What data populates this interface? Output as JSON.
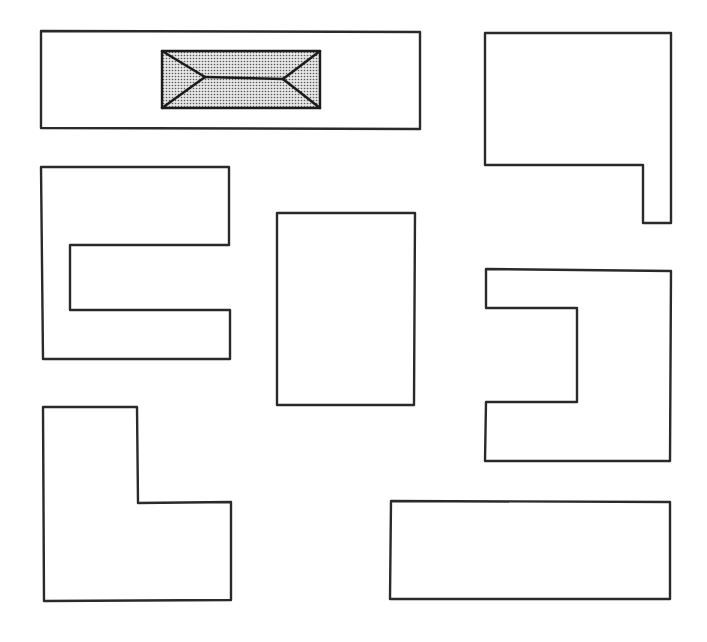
{
  "diagram": {
    "type": "building-footprints-plan",
    "stroke_color": "#2a2a2a",
    "roof_fill_color": "#c8c8c8",
    "shapes": [
      {
        "name": "wide-rectangle-with-hip-roof",
        "points": "41,31 420,32 420,129 41,128"
      },
      {
        "name": "notched-rectangle-top-right",
        "points": "485,33 671,33 671,223 643,223 643,165 485,165"
      },
      {
        "name": "c-shape-left",
        "points": "41,167 229,167 229,245 70,245 70,310 230,310 230,359 43,359"
      },
      {
        "name": "center-rectangle",
        "points": "277,213 415,213 414,405 277,405"
      },
      {
        "name": "reverse-c-shape-right",
        "points": "486,269 671,271 670,461 485,461 486,402 577,402 577,308 486,308"
      },
      {
        "name": "l-shape-bottom-left",
        "points": "43,407 137,407 138,503 231,502 231,600 44,601"
      },
      {
        "name": "long-rectangle-bottom-right",
        "points": "391,501 670,502 670,599 390,599"
      }
    ],
    "hip_roof": {
      "outline": "162,51 320,51 320,108 162,108",
      "ridge_line": {
        "x1": 205,
        "y1": 77,
        "x2": 283,
        "y2": 79
      },
      "hips": [
        {
          "x1": 162,
          "y1": 51,
          "x2": 205,
          "y2": 77
        },
        {
          "x1": 162,
          "y1": 108,
          "x2": 205,
          "y2": 77
        },
        {
          "x1": 320,
          "y1": 51,
          "x2": 283,
          "y2": 79
        },
        {
          "x1": 320,
          "y1": 108,
          "x2": 283,
          "y2": 79
        }
      ]
    }
  }
}
